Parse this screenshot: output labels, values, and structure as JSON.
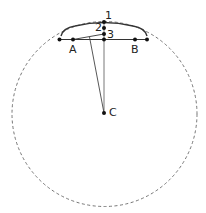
{
  "diagram": {
    "type": "geometry",
    "colors": {
      "stroke": "#333333",
      "dashed_circle": "#666666",
      "background": "#ffffff"
    },
    "labels": {
      "A": "A",
      "B": "B",
      "C": "C",
      "p1": "1",
      "p2": "2",
      "p3": "3"
    },
    "points": {
      "chord_left_end": [
        59.5,
        39.5
      ],
      "A": [
        73,
        39.5
      ],
      "chord_mid": [
        104,
        39.5
      ],
      "B": [
        135,
        39.5
      ],
      "chord_right_end": [
        147,
        39.5
      ],
      "p1": [
        104,
        22
      ],
      "p2": [
        104,
        28
      ],
      "p3": [
        104,
        34
      ],
      "C": [
        104,
        113
      ]
    },
    "circle": {
      "cx": 104.5,
      "cy": 114,
      "r": 93,
      "style": "dashed"
    }
  }
}
